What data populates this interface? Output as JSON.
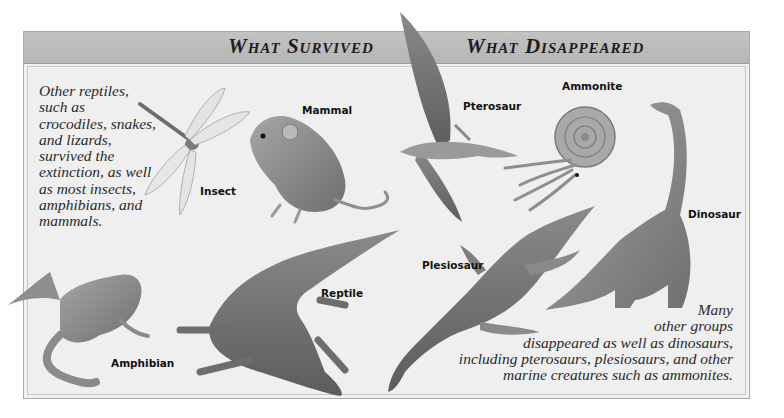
{
  "panel": {
    "left_heading": "What Survived",
    "right_heading": "What Disappeared"
  },
  "captions": {
    "survived": [
      "Other reptiles,",
      "such as",
      "crocodiles, snakes,",
      "and lizards,",
      "survived the",
      "extinction, as well",
      "as most insects,",
      "amphibians, and",
      "mammals."
    ],
    "disappeared": [
      "Many",
      "other groups",
      "disappeared as well as dinosaurs,",
      "including pterosaurs, plesiosaurs, and other",
      "marine creatures such as ammonites."
    ]
  },
  "animals": {
    "survived": [
      {
        "name": "Insect"
      },
      {
        "name": "Mammal"
      },
      {
        "name": "Reptile"
      },
      {
        "name": "Amphibian"
      }
    ],
    "disappeared": [
      {
        "name": "Pterosaur"
      },
      {
        "name": "Ammonite"
      },
      {
        "name": "Dinosaur"
      },
      {
        "name": "Plesiosaur"
      }
    ]
  },
  "colors": {
    "header_bar": "#b9b9b9",
    "panel_bg": "#efefef",
    "border": "#a9a9a9",
    "text": "#1d1d1d"
  }
}
